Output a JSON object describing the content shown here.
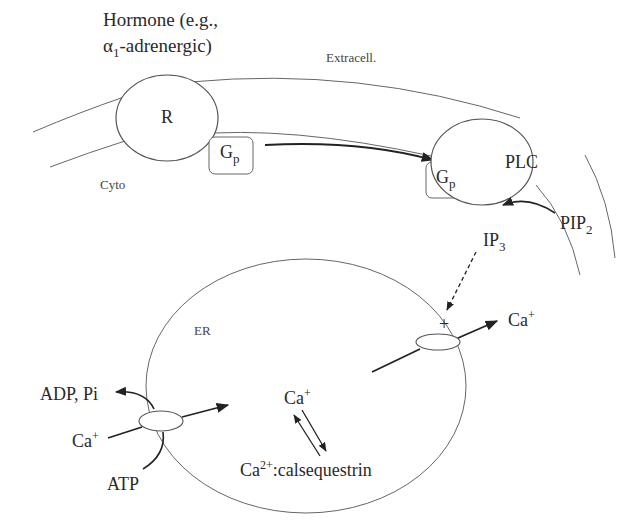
{
  "figure": {
    "hormone_line1": "Hormone (e.g.,",
    "hormone_line2_prefix": "α",
    "hormone_line2_sub": "1",
    "hormone_line2_suffix": "-adrenergic)",
    "extracell_label": "Extracell.",
    "cyto_label": "Cyto",
    "receptor_label": "R",
    "gp_label_main": "G",
    "gp_label_sub": "p",
    "plc_label": "PLC",
    "pip2_main": "PIP",
    "pip2_sub": "2",
    "ip3_main": "IP",
    "ip3_sub": "3",
    "er_label": "ER",
    "plus_sign": "+",
    "ca_out_main": "Ca",
    "ca_out_sup": "+",
    "ca_lumen_main": "Ca",
    "ca_lumen_sup": "+",
    "ca_pump_main": "Ca",
    "ca_pump_sup": "+",
    "adp_pi_label": "ADP, Pi",
    "atp_label": "ATP",
    "calsequestrin_prefix": "Ca",
    "calsequestrin_sup": "2+",
    "calsequestrin_suffix": ":calsequestrin"
  },
  "colors": {
    "stroke": "#555555",
    "arrow": "#222222",
    "text": "#2a2a2a"
  }
}
